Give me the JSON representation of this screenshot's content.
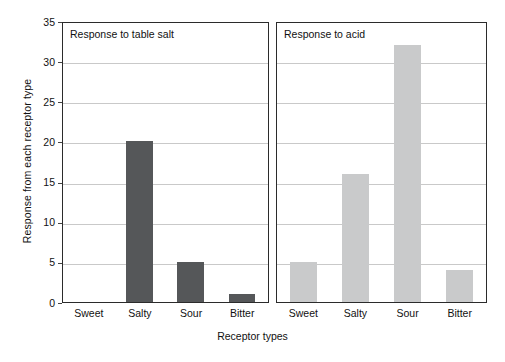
{
  "chart_data": {
    "type": "bar",
    "title": "",
    "xlabel": "Receptor types",
    "ylabel": "Response from each receptor type",
    "categories": [
      "Sweet",
      "Salty",
      "Sour",
      "Bitter"
    ],
    "ylim": [
      0,
      35
    ],
    "yticks": [
      0,
      5,
      10,
      15,
      20,
      25,
      30,
      35
    ],
    "grid": true,
    "legend": "none",
    "panels": [
      {
        "title": "Response to table salt",
        "color": "#555759",
        "values": [
          0,
          20,
          5,
          1
        ]
      },
      {
        "title": "Response to acid",
        "color": "#c9cacb",
        "values": [
          5,
          16,
          32,
          4
        ]
      }
    ]
  },
  "axes": {
    "y_label": "Response from each receptor type",
    "x_label": "Receptor types",
    "y_tick_labels": [
      "0",
      "5",
      "10",
      "15",
      "20",
      "25",
      "30",
      "35"
    ],
    "x_tick_labels": [
      "Sweet",
      "Salty",
      "Sour",
      "Bitter"
    ]
  },
  "panel_left": {
    "title": "Response to table salt",
    "x_tick_labels": [
      "Sweet",
      "Salty",
      "Sour",
      "Bitter"
    ]
  },
  "panel_right": {
    "title": "Response to acid",
    "x_tick_labels": [
      "Sweet",
      "Salty",
      "Sour",
      "Bitter"
    ]
  },
  "colors": {
    "bar_dark": "#555759",
    "bar_light": "#c9cacb",
    "gridline": "#c9c9c9",
    "axis": "#2b2b2b"
  }
}
